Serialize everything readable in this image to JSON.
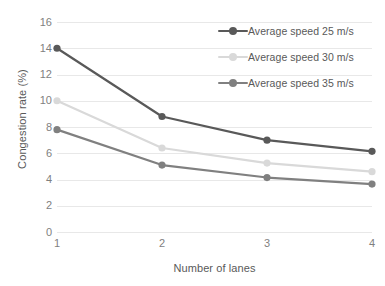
{
  "chart_data": {
    "type": "line",
    "title": "",
    "xlabel": "Number of lanes",
    "ylabel": "Congestion rate (%)",
    "x": [
      1,
      2,
      3,
      4
    ],
    "xtick_labels": [
      "1",
      "2",
      "3",
      "4"
    ],
    "ytick_labels": [
      "0",
      "2",
      "4",
      "6",
      "8",
      "10",
      "12",
      "14",
      "16"
    ],
    "yticks": [
      0,
      2,
      4,
      6,
      8,
      10,
      12,
      14,
      16
    ],
    "ylim": [
      0,
      16
    ],
    "xlim": [
      1,
      4
    ],
    "grid": "horizontal",
    "legend_position": "top-right",
    "series": [
      {
        "name": "Average speed 25 m/s",
        "values": [
          14.0,
          8.8,
          7.0,
          6.15
        ],
        "color": "#595959",
        "marker": "circle"
      },
      {
        "name": "Average speed 30 m/s",
        "values": [
          10.0,
          6.4,
          5.25,
          4.6
        ],
        "color": "#d9d9d9",
        "marker": "circle"
      },
      {
        "name": "Average speed 35 m/s",
        "values": [
          7.8,
          5.1,
          4.15,
          3.65
        ],
        "color": "#808080",
        "marker": "circle"
      }
    ]
  },
  "style": {
    "background": "#ffffff",
    "gridline_color": "#e8e8e8",
    "tick_label_color": "#7f7f7f",
    "axis_title_color": "#595959"
  }
}
